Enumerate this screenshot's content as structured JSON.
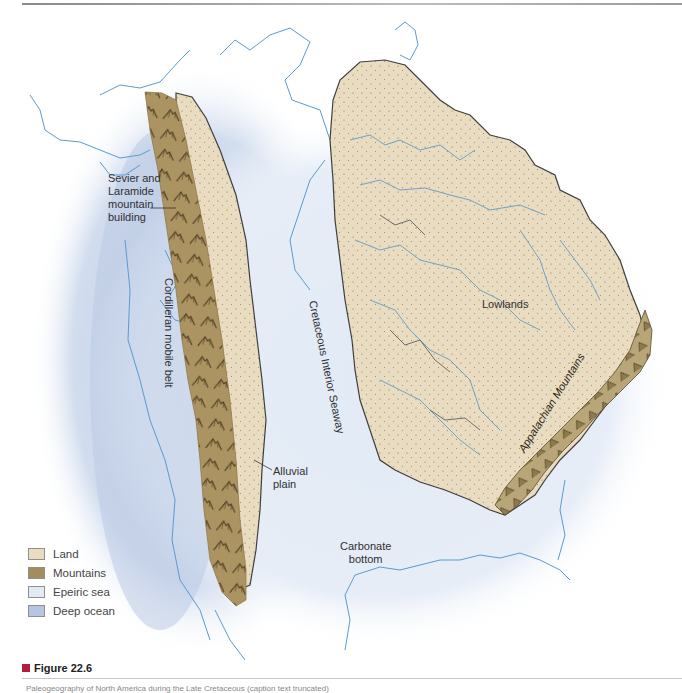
{
  "figure": {
    "title": "Figure 22.6",
    "caption": "Paleogeography of North America during the Late Cretaceous (caption text truncated)"
  },
  "labels": {
    "sevier": [
      "Sevier and",
      "Laramide",
      "mountain",
      "building"
    ],
    "cordilleran": "Cordilleran mobile belt",
    "seaway": "Cretaceous Interior Seaway",
    "lowlands": "Lowlands",
    "appalachian": "Appalachian Mountains",
    "alluvial": [
      "Alluvial",
      "plain"
    ],
    "carbonate": [
      "Carbonate",
      "bottom"
    ]
  },
  "legend": {
    "items": [
      {
        "label": "Land",
        "color": "#eadcc0"
      },
      {
        "label": "Mountains",
        "color": "#a48d5c"
      },
      {
        "label": "Epeiric sea",
        "color": "#e2eaf5"
      },
      {
        "label": "Deep ocean",
        "color": "#b4c6e2"
      }
    ]
  },
  "colors": {
    "land": "#eadcc0",
    "mountains": "#ab9462",
    "epeiric_sea": "#e2eaf5",
    "deep_ocean": "#b4c6e2",
    "coastline": "#5a9bd0",
    "outline": "#4a4a4a",
    "accent": "#b0203a"
  }
}
